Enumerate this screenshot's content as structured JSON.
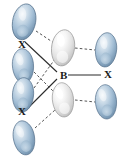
{
  "figure": {
    "name": "orbital-overlap-diagram",
    "width": 123,
    "height": 157,
    "background": "#ffffff"
  },
  "labels": [
    {
      "id": "x-top-left",
      "text": "X",
      "x": 18,
      "y": 39
    },
    {
      "id": "b-center",
      "text": "B",
      "x": 60,
      "y": 70
    },
    {
      "id": "x-right",
      "text": "X",
      "x": 104,
      "y": 69
    },
    {
      "id": "x-bottom-left",
      "text": "X",
      "x": 18,
      "y": 106
    }
  ],
  "orbitals": [
    {
      "id": "orbital-left-1",
      "group": "ligand-left",
      "fill": "blue",
      "cx": 24,
      "cy": 22,
      "rx": 13,
      "ry": 19,
      "rotate": 12
    },
    {
      "id": "orbital-left-2",
      "group": "ligand-left",
      "fill": "blue",
      "cx": 23,
      "cy": 66,
      "rx": 12,
      "ry": 18,
      "rotate": -4
    },
    {
      "id": "orbital-left-3",
      "group": "ligand-left",
      "fill": "blue",
      "cx": 23,
      "cy": 95,
      "rx": 12,
      "ry": 18,
      "rotate": 4
    },
    {
      "id": "orbital-left-4",
      "group": "ligand-left",
      "fill": "blue",
      "cx": 24,
      "cy": 138,
      "rx": 12,
      "ry": 18,
      "rotate": -10
    },
    {
      "id": "orbital-center-top",
      "group": "boron-hybrid",
      "fill": "white",
      "cx": 63,
      "cy": 48,
      "rx": 13,
      "ry": 19,
      "rotate": 8
    },
    {
      "id": "orbital-center-bottom",
      "group": "boron-hybrid",
      "fill": "white",
      "cx": 63,
      "cy": 100,
      "rx": 12,
      "ry": 18,
      "rotate": -6
    },
    {
      "id": "orbital-right-1",
      "group": "ligand-right",
      "fill": "blue",
      "cx": 106,
      "cy": 50,
      "rx": 12,
      "ry": 18,
      "rotate": 6
    },
    {
      "id": "orbital-right-2",
      "group": "ligand-right",
      "fill": "blue",
      "cx": 106,
      "cy": 102,
      "rx": 12,
      "ry": 18,
      "rotate": -4
    }
  ],
  "bonds_solid": [
    {
      "id": "bond-b-to-x-right",
      "x1": 68,
      "y1": 75,
      "x2": 101,
      "y2": 75
    },
    {
      "id": "bond-b-to-x-top-left",
      "x1": 57,
      "y1": 72,
      "x2": 25,
      "y2": 42
    },
    {
      "id": "bond-b-to-x-bottom-left",
      "x1": 57,
      "y1": 79,
      "x2": 26,
      "y2": 110
    }
  ],
  "overlap_dashed": [
    {
      "id": "overlap-left1-to-center-top",
      "x1": 36,
      "y1": 31,
      "x2": 54,
      "y2": 43
    },
    {
      "id": "overlap-left2-to-center-bottom",
      "x1": 34,
      "y1": 72,
      "x2": 55,
      "y2": 93
    },
    {
      "id": "overlap-left3-to-center-top",
      "x1": 34,
      "y1": 88,
      "x2": 55,
      "y2": 59
    },
    {
      "id": "overlap-left4-to-center-bottom",
      "x1": 35,
      "y1": 128,
      "x2": 55,
      "y2": 110
    },
    {
      "id": "overlap-center-top-to-right1",
      "x1": 75,
      "y1": 48,
      "x2": 95,
      "y2": 50
    },
    {
      "id": "overlap-center-bottom-to-right2",
      "x1": 75,
      "y1": 100,
      "x2": 95,
      "y2": 102
    }
  ],
  "colors": {
    "bond_line": "#2b2b2b",
    "dashed_line": "#555555",
    "orbital_blue_light": "#e8eff6",
    "orbital_blue_mid": "#a9c2d8",
    "orbital_blue_dark": "#6d8ba6",
    "orbital_blue_edge": "#55718c",
    "orbital_white_light": "#ffffff",
    "orbital_white_mid": "#ececec",
    "orbital_white_dark": "#c4c4c4",
    "orbital_white_edge": "#9a9a9a",
    "label_text": "#1a1a1a"
  }
}
